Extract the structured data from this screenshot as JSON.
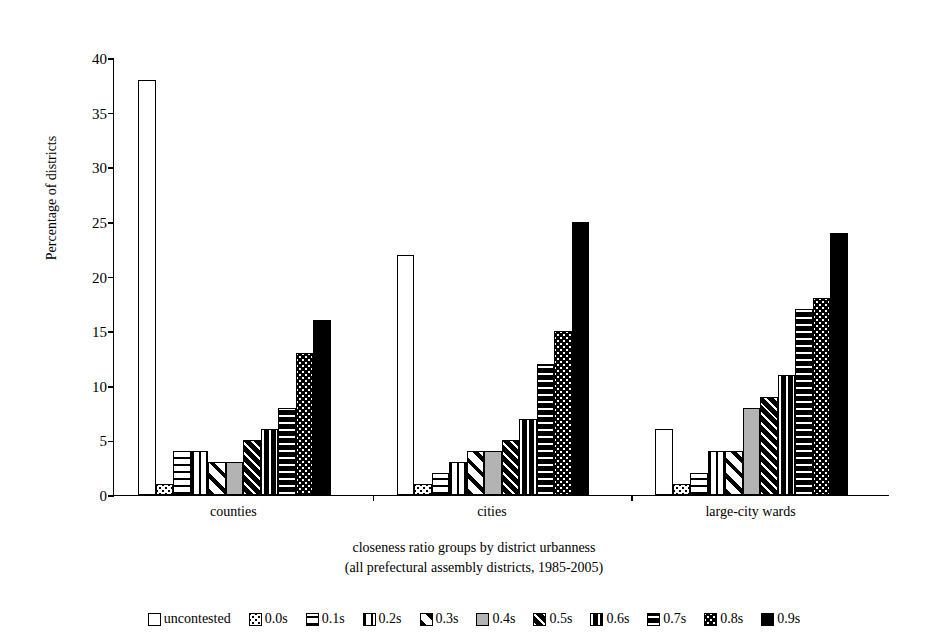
{
  "chart_data": {
    "type": "bar",
    "title": "",
    "xlabel": "closeness ratio groups by district urbanness",
    "xlabel_line2": "(all prefectural assembly districts, 1985-2005)",
    "ylabel": "Percentage of districts",
    "ylim": [
      0,
      40
    ],
    "yticks": [
      0,
      5,
      10,
      15,
      20,
      25,
      30,
      35,
      40
    ],
    "grid": false,
    "legend_position": "bottom",
    "categories": [
      "counties",
      "cities",
      "large-city wards"
    ],
    "series": [
      {
        "name": "uncontested",
        "pattern": "white-solid",
        "values": [
          38,
          22,
          6
        ]
      },
      {
        "name": "0.0s",
        "pattern": "light-dots",
        "values": [
          1,
          1,
          1
        ]
      },
      {
        "name": "0.1s",
        "pattern": "light-dashes",
        "values": [
          4,
          2,
          2
        ]
      },
      {
        "name": "0.2s",
        "pattern": "light-vertical",
        "values": [
          4,
          3,
          4
        ]
      },
      {
        "name": "0.3s",
        "pattern": "light-diagonal",
        "values": [
          3,
          4,
          4
        ]
      },
      {
        "name": "0.4s",
        "pattern": "gray-solid",
        "values": [
          3,
          4,
          8
        ]
      },
      {
        "name": "0.5s",
        "pattern": "dark-diagonal",
        "values": [
          5,
          5,
          9
        ]
      },
      {
        "name": "0.6s",
        "pattern": "dark-vertical",
        "values": [
          6,
          7,
          11
        ]
      },
      {
        "name": "0.7s",
        "pattern": "dark-dashes",
        "values": [
          8,
          12,
          17
        ]
      },
      {
        "name": "0.8s",
        "pattern": "dark-dots",
        "values": [
          13,
          15,
          18
        ]
      },
      {
        "name": "0.9s",
        "pattern": "black-solid",
        "values": [
          16,
          25,
          24
        ]
      }
    ]
  },
  "colors": {
    "axis": "#000000",
    "gray_fill": "#b3b3b3",
    "dark_fill": "#000000",
    "background": "#ffffff"
  }
}
